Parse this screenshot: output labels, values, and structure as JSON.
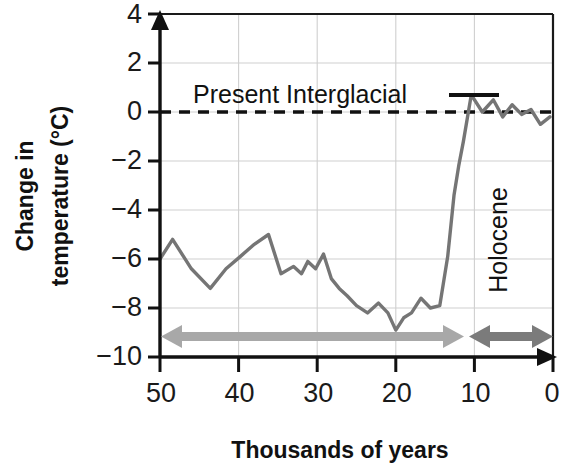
{
  "chart_data": {
    "type": "line",
    "title": "",
    "xlabel": "Thousands of years",
    "ylabel": "Change in temperature (°C)",
    "ylabel_line1": "Change in",
    "ylabel_line2": "temperature (°C)",
    "xlim": [
      50,
      0
    ],
    "ylim": [
      -10,
      4
    ],
    "x_reversed": true,
    "grid": true,
    "legend": "none",
    "xticks": [
      50,
      40,
      30,
      20,
      10,
      0
    ],
    "xtick_labels": [
      "50",
      "40",
      "30",
      "20",
      "10",
      "0"
    ],
    "yticks": [
      4,
      2,
      0,
      -2,
      -4,
      -6,
      -8,
      -10
    ],
    "ytick_labels": [
      "4",
      "2",
      "0",
      "−2",
      "−4",
      "−6",
      "−8",
      "−10"
    ],
    "series": [
      {
        "name": "Change in temperature",
        "color": "#757575",
        "x": [
          50.0,
          48.4,
          46.0,
          43.6,
          41.6,
          39.8,
          38.0,
          36.2,
          34.6,
          33.0,
          32.0,
          31.2,
          30.2,
          29.2,
          28.2,
          27.2,
          26.2,
          25.0,
          23.6,
          22.2,
          21.0,
          20.0,
          19.0,
          18.0,
          16.8,
          15.6,
          14.4,
          13.4,
          12.6,
          12.0,
          11.4,
          10.4,
          9.0,
          7.6,
          6.4,
          5.2,
          4.0,
          2.8,
          1.6,
          0.4
        ],
        "y": [
          -6.0,
          -5.2,
          -6.4,
          -7.2,
          -6.4,
          -5.9,
          -5.4,
          -5.0,
          -6.6,
          -6.3,
          -6.6,
          -6.1,
          -6.4,
          -5.8,
          -6.8,
          -7.2,
          -7.5,
          -7.9,
          -8.2,
          -7.8,
          -8.2,
          -8.9,
          -8.4,
          -8.2,
          -7.6,
          -8.0,
          -7.9,
          -5.9,
          -3.4,
          -2.2,
          -1.2,
          0.7,
          0.0,
          0.5,
          -0.2,
          0.3,
          -0.1,
          0.1,
          -0.5,
          -0.2
        ],
        "units": "°C"
      }
    ],
    "reference_lines": [
      {
        "name": "zero-line",
        "axis": "y",
        "value": 0,
        "style": "dashed",
        "color": "#111111"
      }
    ],
    "annotations": [
      {
        "name": "present-interglacial",
        "text": "Present Interglacial",
        "points_to_x": 11,
        "points_to_y": 0.7
      },
      {
        "name": "holocene",
        "text": "Holocene",
        "orientation": "vertical",
        "span_start_x": 11,
        "span_end_x": 0
      }
    ],
    "span_arrows": [
      {
        "name": "glacial-span",
        "from_x": 50,
        "to_x": 11.5,
        "at_y": -8.9,
        "color": "#a8a8a8"
      },
      {
        "name": "holocene-span",
        "from_x": 11.2,
        "to_x": 0,
        "at_y": -8.9,
        "color": "#7b7b7b"
      }
    ]
  }
}
